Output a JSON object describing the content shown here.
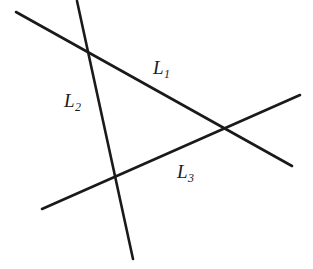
{
  "figure": {
    "kind": "geometry-diagram",
    "width": 313,
    "height": 269,
    "background_color": "#ffffff",
    "stroke_color": "#1a1a1a",
    "stroke_width": 2.6,
    "lines": [
      {
        "id": "L1",
        "label_text": "L",
        "label_sub": "1",
        "x1": 16,
        "y1": 12,
        "x2": 292,
        "y2": 166
      },
      {
        "id": "L2",
        "label_text": "L",
        "label_sub": "2",
        "x1": 77,
        "y1": 1,
        "x2": 133,
        "y2": 259
      },
      {
        "id": "L3",
        "label_text": "L",
        "label_sub": "3",
        "x1": 42,
        "y1": 209,
        "x2": 300,
        "y2": 95
      }
    ],
    "intersections": [
      {
        "id": "L1-L2",
        "x": 86,
        "y": 51
      },
      {
        "id": "L1-L3",
        "x": 225,
        "y": 130
      },
      {
        "id": "L2-L3",
        "x": 113,
        "y": 180
      }
    ]
  }
}
